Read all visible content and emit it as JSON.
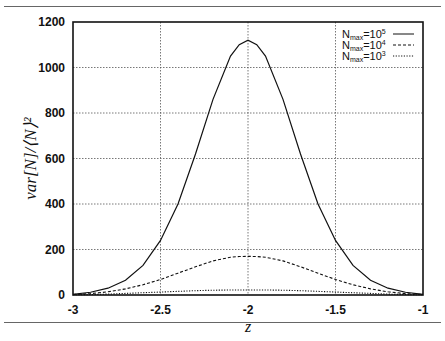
{
  "chart_data": {
    "type": "line",
    "title": "",
    "xlabel": "z",
    "ylabel": "var[N]/⟨N⟩²",
    "xlim": [
      -3,
      -1
    ],
    "ylim": [
      0,
      1200
    ],
    "x_ticks": [
      "-3",
      "-2.5",
      "-2",
      "-1.5",
      "-1"
    ],
    "y_ticks": [
      "0",
      "200",
      "400",
      "600",
      "800",
      "1000",
      "1200"
    ],
    "grid": true,
    "legend_position": "top-right",
    "x": [
      -3.0,
      -2.9,
      -2.8,
      -2.7,
      -2.6,
      -2.5,
      -2.4,
      -2.3,
      -2.2,
      -2.1,
      -2.05,
      -2.0,
      -1.95,
      -1.9,
      -1.8,
      -1.7,
      -1.6,
      -1.5,
      -1.4,
      -1.3,
      -1.2,
      -1.1,
      -1.0
    ],
    "series": [
      {
        "name": "N_max=10^5",
        "style": "solid",
        "values": [
          3,
          12,
          30,
          65,
          130,
          240,
          400,
          620,
          860,
          1050,
          1100,
          1120,
          1100,
          1050,
          860,
          620,
          400,
          240,
          130,
          65,
          30,
          12,
          3
        ]
      },
      {
        "name": "N_max=10^4",
        "style": "dashed",
        "values": [
          2,
          6,
          14,
          27,
          45,
          68,
          96,
          124,
          150,
          166,
          169,
          170,
          169,
          166,
          150,
          124,
          96,
          68,
          45,
          27,
          14,
          6,
          2
        ]
      },
      {
        "name": "N_max=10^3",
        "style": "dotted",
        "values": [
          1,
          2,
          4,
          7,
          10,
          13,
          16,
          19,
          21,
          22,
          22,
          22,
          22,
          22,
          21,
          19,
          16,
          13,
          10,
          7,
          4,
          2,
          1
        ]
      }
    ]
  },
  "legend": [
    {
      "base": "N",
      "sub": "max",
      "eq": "=10",
      "sup": "5"
    },
    {
      "base": "N",
      "sub": "max",
      "eq": "=10",
      "sup": "4"
    },
    {
      "base": "N",
      "sub": "max",
      "eq": "=10",
      "sup": "3"
    }
  ]
}
